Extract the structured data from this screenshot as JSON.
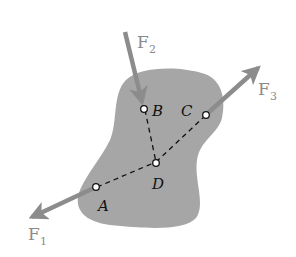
{
  "diagram": {
    "colors": {
      "body_fill": "#a6a6a6",
      "arrow": "#8c8c8c",
      "label": "#8a8a8a",
      "point_label": "#111111"
    },
    "forces": [
      {
        "id": "F1",
        "label": "F",
        "subscript": "1",
        "applied_at": "A"
      },
      {
        "id": "F2",
        "label": "F",
        "subscript": "2",
        "applied_at": "B"
      },
      {
        "id": "F3",
        "label": "F",
        "subscript": "3",
        "applied_at": "C"
      }
    ],
    "points": [
      {
        "id": "A",
        "label": "A"
      },
      {
        "id": "B",
        "label": "B"
      },
      {
        "id": "C",
        "label": "C"
      },
      {
        "id": "D",
        "label": "D"
      }
    ]
  }
}
